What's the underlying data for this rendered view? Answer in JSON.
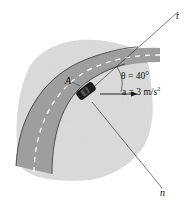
{
  "figure": {
    "axes": {
      "tangent_label": "t",
      "normal_label": "n"
    },
    "point_label": "A",
    "angle": {
      "symbol": "θ",
      "text": "θ = 40°",
      "value_deg": 40
    },
    "acceleration": {
      "symbol": "a",
      "text": "a = 3 m/s",
      "superscript": "2",
      "value": 3,
      "unit": "m/s²"
    },
    "colors": {
      "background": "#ffffff",
      "terrain": "#d9d9d9",
      "road": "#9a9a9a",
      "road_edge": "#333333",
      "lane_dash": "#ffffff",
      "car": "#1a1a1a",
      "lines": "#222222"
    }
  }
}
